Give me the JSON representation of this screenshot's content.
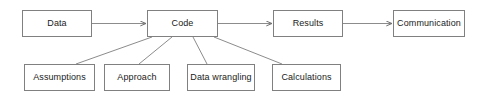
{
  "diagram": {
    "type": "flowchart",
    "title": "",
    "background_color": "#ffffff",
    "box_border_color": "#808080",
    "box_fill_color": "#ffffff",
    "connector_color": "#8c8c8c",
    "text_color": "#1a1a1a",
    "pipeline": {
      "label": "main-pipeline",
      "nodes": [
        {
          "id": "data",
          "label": "Data",
          "x": 22,
          "y": 10,
          "w": 70,
          "h": 27
        },
        {
          "id": "code",
          "label": "Code",
          "x": 147,
          "y": 10,
          "w": 71,
          "h": 27
        },
        {
          "id": "results",
          "label": "Results",
          "x": 273,
          "y": 10,
          "w": 70,
          "h": 27
        },
        {
          "id": "communication",
          "label": "Communication",
          "x": 393,
          "y": 10,
          "w": 72,
          "h": 27
        }
      ],
      "arrows": [
        {
          "from": "data",
          "to": "code",
          "arrowhead": "open"
        },
        {
          "from": "code",
          "to": "results",
          "arrowhead": "open"
        },
        {
          "from": "results",
          "to": "communication",
          "arrowhead": "open"
        }
      ]
    },
    "components": {
      "label": "code-components",
      "parent": "code",
      "connector_style": "plain-line-fan",
      "nodes": [
        {
          "id": "assumptions",
          "label": "Assumptions",
          "x": 24,
          "y": 64,
          "w": 71,
          "h": 27
        },
        {
          "id": "approach",
          "label": "Approach",
          "x": 104,
          "y": 64,
          "w": 66,
          "h": 27
        },
        {
          "id": "data-wrangling",
          "label": "Data wrangling",
          "x": 187,
          "y": 64,
          "w": 68,
          "h": 27
        },
        {
          "id": "calculations",
          "label": "Calculations",
          "x": 272,
          "y": 64,
          "w": 69,
          "h": 27
        }
      ]
    }
  }
}
